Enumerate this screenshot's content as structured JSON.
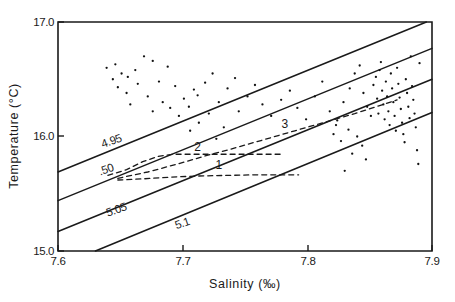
{
  "figure": {
    "kind": "temperature-salinity-diagram"
  },
  "chart_data": {
    "type": "scatter",
    "title": "",
    "xlabel": "Salinity  (‰)",
    "ylabel": "Temperature  (°C)",
    "xlim": [
      7.6,
      7.9
    ],
    "ylim": [
      15.0,
      17.0
    ],
    "grid": false,
    "legend": "none",
    "xticks": [
      7.6,
      7.7,
      7.8,
      7.9
    ],
    "xtick_labels": [
      "7.6",
      "7.7",
      "7.8",
      "7.9"
    ],
    "yticks": [
      15.0,
      16.0,
      17.0
    ],
    "ytick_labels": [
      "15.0",
      "16.0",
      "17.0"
    ],
    "series": [
      {
        "name": "observations",
        "marker": "dot",
        "x": [
          7.639,
          7.646,
          7.651,
          7.644,
          7.648,
          7.656,
          7.662,
          7.669,
          7.676,
          7.664,
          7.655,
          7.658,
          7.672,
          7.681,
          7.688,
          7.694,
          7.684,
          7.676,
          7.69,
          7.701,
          7.709,
          7.697,
          7.705,
          7.712,
          7.718,
          7.724,
          7.713,
          7.706,
          7.721,
          7.729,
          7.736,
          7.742,
          7.733,
          7.727,
          7.745,
          7.752,
          7.758,
          7.764,
          7.771,
          7.779,
          7.786,
          7.792,
          7.799,
          7.806,
          7.812,
          7.818,
          7.823,
          7.829,
          7.834,
          7.838,
          7.842,
          7.845,
          7.848,
          7.851,
          7.853,
          7.855,
          7.856,
          7.857,
          7.858,
          7.859,
          7.86,
          7.861,
          7.862,
          7.863,
          7.864,
          7.865,
          7.866,
          7.867,
          7.868,
          7.869,
          7.87,
          7.871,
          7.872,
          7.873,
          7.874,
          7.875,
          7.876,
          7.877,
          7.878,
          7.879,
          7.88,
          7.881,
          7.882,
          7.883,
          7.884,
          7.885,
          7.886,
          7.887,
          7.888,
          7.889,
          7.89,
          7.847,
          7.844,
          7.84,
          7.836,
          7.833,
          7.83,
          7.827,
          7.824,
          7.821
        ],
        "y": [
          16.6,
          16.63,
          16.55,
          16.5,
          16.43,
          16.52,
          16.58,
          16.7,
          16.66,
          16.46,
          16.38,
          16.28,
          16.35,
          16.48,
          16.61,
          16.44,
          16.3,
          16.22,
          16.25,
          16.33,
          16.41,
          16.18,
          16.26,
          16.36,
          16.47,
          16.55,
          16.12,
          16.05,
          16.2,
          16.3,
          16.42,
          16.51,
          16.08,
          15.98,
          16.22,
          16.35,
          16.45,
          16.28,
          16.18,
          16.32,
          16.4,
          16.25,
          16.15,
          16.35,
          16.48,
          16.22,
          16.1,
          16.3,
          16.42,
          16.55,
          16.62,
          16.38,
          16.26,
          16.18,
          16.45,
          16.52,
          16.33,
          16.2,
          16.58,
          16.65,
          16.4,
          16.28,
          16.15,
          16.48,
          16.35,
          16.22,
          16.1,
          16.55,
          16.42,
          16.3,
          16.18,
          16.05,
          16.6,
          16.46,
          16.34,
          16.24,
          16.12,
          16.02,
          15.95,
          16.5,
          16.38,
          16.26,
          16.16,
          16.7,
          16.44,
          16.32,
          16.2,
          16.08,
          15.88,
          15.76,
          16.64,
          15.8,
          15.92,
          16.0,
          15.85,
          16.06,
          15.7,
          15.96,
          16.14,
          16.02
        ]
      }
    ],
    "isopycnals": [
      {
        "label": "4.95",
        "label_x": 7.636,
        "label_y": 15.9,
        "x0": 7.6,
        "y0": 15.69,
        "x1": 7.9,
        "y1": 17.02
      },
      {
        "label": ".50",
        "label_x": 7.634,
        "label_y": 15.66,
        "x0": 7.6,
        "y0": 15.44,
        "x1": 7.9,
        "y1": 16.77
      },
      {
        "label": "5.05",
        "label_x": 7.64,
        "label_y": 15.3,
        "x0": 7.6,
        "y0": 15.17,
        "x1": 7.9,
        "y1": 16.5
      },
      {
        "label": "5.1",
        "label_x": 7.695,
        "label_y": 15.19,
        "x0": 7.63,
        "y0": 15.0,
        "x1": 7.9,
        "y1": 16.21
      }
    ],
    "trajectories": [
      {
        "label": "1",
        "label_x": 7.729,
        "label_y": 15.72,
        "points": [
          [
            7.648,
            15.62
          ],
          [
            7.668,
            15.63
          ],
          [
            7.69,
            15.645
          ],
          [
            7.712,
            15.655
          ],
          [
            7.734,
            15.66
          ],
          [
            7.756,
            15.665
          ],
          [
            7.778,
            15.665
          ],
          [
            7.793,
            15.665
          ]
        ]
      },
      {
        "label": "2",
        "label_x": 7.712,
        "label_y": 15.875,
        "points": [
          [
            7.64,
            15.66
          ],
          [
            7.655,
            15.71
          ],
          [
            7.668,
            15.78
          ],
          [
            7.68,
            15.825
          ],
          [
            7.692,
            15.845
          ],
          [
            7.704,
            15.845
          ],
          [
            7.716,
            15.845
          ],
          [
            7.73,
            15.845
          ],
          [
            7.748,
            15.845
          ],
          [
            7.765,
            15.845
          ],
          [
            7.78,
            15.845
          ]
        ]
      },
      {
        "label": "3",
        "label_x": 7.782,
        "label_y": 16.07,
        "points": [
          [
            7.648,
            15.635
          ],
          [
            7.672,
            15.69
          ],
          [
            7.696,
            15.76
          ],
          [
            7.718,
            15.83
          ],
          [
            7.742,
            15.9
          ],
          [
            7.766,
            15.975
          ],
          [
            7.79,
            16.05
          ],
          [
            7.814,
            16.125
          ],
          [
            7.838,
            16.2
          ],
          [
            7.858,
            16.27
          ],
          [
            7.872,
            16.32
          ]
        ]
      }
    ]
  }
}
